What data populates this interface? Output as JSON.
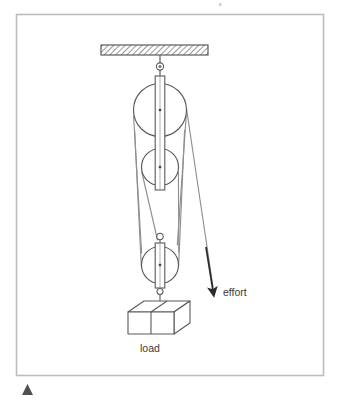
{
  "figure": {
    "title_text": "",
    "domain": "pulley-block-and-tackle-diagram",
    "background_color": "#ffffff",
    "frame": {
      "name": "diagram-border",
      "stroke_color": "#b9b9b9",
      "x": 16,
      "y": 14,
      "width": 308,
      "height": 362
    },
    "labels": {
      "effort": "effort",
      "load": "load"
    },
    "colors": {
      "line": "#5a5a5a",
      "rope": "#8a8a8a",
      "hatch": "#6d6d6d",
      "text": "#3a3a3a",
      "arrow": "#2b2b2b",
      "marker": "#555555"
    },
    "ceiling": {
      "name": "ceiling-beam",
      "x": 101,
      "y": 45,
      "width": 107,
      "height": 10,
      "hatch_angle_deg": 45,
      "hatch_spacing_px": 4
    },
    "pulleys": [
      {
        "name": "top-pulley",
        "cx": 160,
        "cy": 110,
        "r": 26.5,
        "strap_top": 76,
        "strap_bottom": 146
      },
      {
        "name": "middle-pulley",
        "cx": 160,
        "cy": 167,
        "r": 18.5,
        "strap_top": 76,
        "strap_bottom": 190
      },
      {
        "name": "bottom-pulley",
        "cx": 160,
        "cy": 265,
        "r": 18.5,
        "strap_top": 242,
        "strap_bottom": 288
      }
    ],
    "hooks": [
      {
        "name": "ceiling-eye-hook",
        "cx": 160,
        "cy": 68
      },
      {
        "name": "bottom-block-eye",
        "cx": 160,
        "cy": 237
      },
      {
        "name": "load-hook",
        "cx": 160,
        "cy": 293
      }
    ],
    "load_block": {
      "name": "load-box",
      "front_x": 128,
      "front_y": 312,
      "front_w": 46,
      "front_h": 22,
      "depth_x": 16,
      "depth_y": -11,
      "divider_x": 151
    },
    "effort": {
      "name": "effort-arrow",
      "x1": 189,
      "y1": 123,
      "x2": 213,
      "y2": 290,
      "label_x": 222,
      "label_y": 296
    },
    "corner_marker": {
      "name": "page-corner-marker",
      "x": 22,
      "y": 384,
      "size": 11
    },
    "ropes": [
      {
        "name": "rope-effort-segment",
        "points": "186.5,110 213,290"
      },
      {
        "name": "rope-top-right-down",
        "points": "186.0,116 176.5,242"
      },
      {
        "name": "rope-top-left-down",
        "points": "133.5,116 142.5,252"
      },
      {
        "name": "rope-mid-left-down",
        "points": "141.8,172 147.5,253"
      },
      {
        "name": "rope-mid-right-down",
        "points": "178.2,172 172.0,252"
      },
      {
        "name": "rope-bottom-left-up",
        "points": "141.5,265 134.0,118"
      },
      {
        "name": "rope-bottom-right-up",
        "points": "178.5,265 184.5,120"
      }
    ]
  }
}
